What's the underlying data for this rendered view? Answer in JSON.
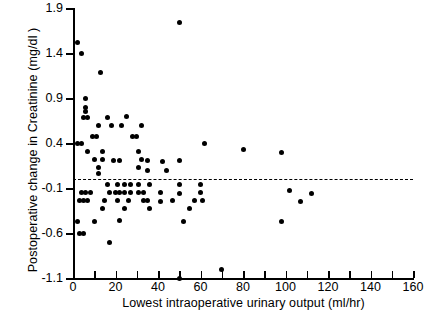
{
  "chart_data": {
    "type": "scatter",
    "title": "",
    "xlabel": "Lowest intraoperative urinary output  (ml/hr)",
    "ylabel": "Postoperative change in Creatinine (mg/dl )",
    "xlim": [
      0,
      160
    ],
    "ylim": [
      -1.1,
      1.9
    ],
    "xticks": [
      0,
      10,
      20,
      30,
      40,
      50,
      60,
      70,
      80,
      90,
      100,
      110,
      120,
      130,
      140,
      150,
      160
    ],
    "xtick_labels": [
      "0",
      "",
      "20",
      "",
      "40",
      "",
      "60",
      "",
      "80",
      "",
      "100",
      "",
      "120",
      "",
      "140",
      "",
      "160"
    ],
    "yticks": [
      1.9,
      1.4,
      0.9,
      0.4,
      -0.1,
      -0.6,
      -1.1
    ],
    "ytick_labels": [
      "1.9",
      "1.4",
      "0.9",
      "0.4",
      "-0.1",
      "-0.6",
      "-1.1"
    ],
    "grid": false,
    "legend": null,
    "reference_line": {
      "orientation": "horizontal",
      "y": 0.0,
      "style": "dashed",
      "color": "#000000"
    },
    "marker": {
      "shape": "circle",
      "color": "#000000",
      "size": 5
    },
    "points": [
      [
        2,
        1.52
      ],
      [
        4,
        1.39
      ],
      [
        13,
        1.18
      ],
      [
        50,
        1.74
      ],
      [
        6,
        0.9
      ],
      [
        6,
        0.79
      ],
      [
        6,
        0.75
      ],
      [
        5,
        0.68
      ],
      [
        7,
        0.68
      ],
      [
        16,
        0.68
      ],
      [
        25,
        0.69
      ],
      [
        12,
        0.6
      ],
      [
        18,
        0.59
      ],
      [
        23,
        0.59
      ],
      [
        32,
        0.6
      ],
      [
        9,
        0.47
      ],
      [
        11,
        0.47
      ],
      [
        28,
        0.47
      ],
      [
        30,
        0.47
      ],
      [
        2,
        0.4
      ],
      [
        4,
        0.4
      ],
      [
        62,
        0.4
      ],
      [
        7,
        0.31
      ],
      [
        14,
        0.31
      ],
      [
        31,
        0.31
      ],
      [
        14,
        0.22
      ],
      [
        32,
        0.22
      ],
      [
        10,
        0.22
      ],
      [
        19,
        0.21
      ],
      [
        22,
        0.21
      ],
      [
        35,
        0.21
      ],
      [
        12,
        0.13
      ],
      [
        31,
        0.13
      ],
      [
        42,
        0.2
      ],
      [
        50,
        0.21
      ],
      [
        80,
        0.33
      ],
      [
        98,
        0.3
      ],
      [
        12,
        0.06
      ],
      [
        35,
        0.1
      ],
      [
        44,
        0.1
      ],
      [
        16,
        -0.06
      ],
      [
        21,
        -0.06
      ],
      [
        24,
        -0.06
      ],
      [
        27,
        -0.06
      ],
      [
        31,
        -0.06
      ],
      [
        36,
        -0.06
      ],
      [
        50,
        -0.06
      ],
      [
        60,
        -0.06
      ],
      [
        4,
        -0.15
      ],
      [
        6,
        -0.15
      ],
      [
        8,
        -0.15
      ],
      [
        17,
        -0.15
      ],
      [
        20,
        -0.15
      ],
      [
        22,
        -0.15
      ],
      [
        24,
        -0.15
      ],
      [
        27,
        -0.15
      ],
      [
        31,
        -0.15
      ],
      [
        33,
        -0.15
      ],
      [
        41,
        -0.15
      ],
      [
        50,
        -0.16
      ],
      [
        60,
        -0.15
      ],
      [
        102,
        -0.13
      ],
      [
        112,
        -0.16
      ],
      [
        3,
        -0.24
      ],
      [
        5,
        -0.24
      ],
      [
        7,
        -0.24
      ],
      [
        15,
        -0.24
      ],
      [
        21,
        -0.24
      ],
      [
        26,
        -0.24
      ],
      [
        33,
        -0.24
      ],
      [
        35,
        -0.24
      ],
      [
        41,
        -0.25
      ],
      [
        47,
        -0.24
      ],
      [
        57,
        -0.24
      ],
      [
        61,
        -0.24
      ],
      [
        107,
        -0.25
      ],
      [
        14,
        -0.33
      ],
      [
        24,
        -0.33
      ],
      [
        36,
        -0.33
      ],
      [
        55,
        -0.33
      ],
      [
        2,
        -0.47
      ],
      [
        10,
        -0.47
      ],
      [
        22,
        -0.46
      ],
      [
        52,
        -0.47
      ],
      [
        98,
        -0.47
      ],
      [
        3,
        -0.6
      ],
      [
        5,
        -0.6
      ],
      [
        17,
        -0.7
      ],
      [
        50,
        -1.1
      ],
      [
        70,
        -1.0
      ]
    ]
  },
  "axes": {
    "xlabel": "Lowest intraoperative urinary output  (ml/hr)",
    "ylabel": "Postoperative change in Creatinine (mg/dl )"
  }
}
